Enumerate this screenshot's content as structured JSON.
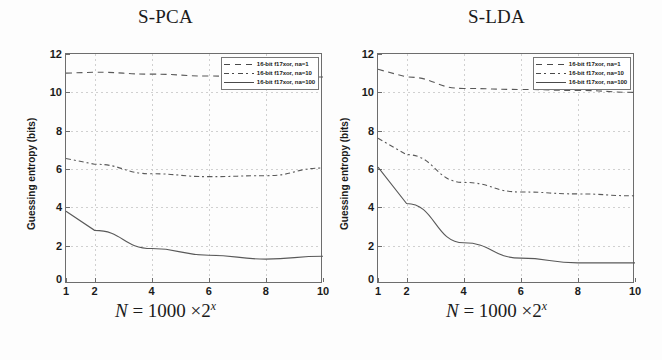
{
  "figure": {
    "panels": [
      {
        "key": "s_pca",
        "title": "S-PCA",
        "xlabel_prefix": "N",
        "xlabel_eq": "=",
        "xlabel_base": "1000",
        "xlabel_times": "×",
        "xlabel_pow_base": "2",
        "xlabel_pow_exp": "x",
        "ylabel": "Guessing entropy (bits)",
        "yticks": [
          "12",
          "10",
          "8",
          "6",
          "4",
          "2"
        ],
        "ytick_zero": "0",
        "xticks": [
          "1",
          "2",
          "4",
          "6",
          "8",
          "10"
        ],
        "legend": [
          {
            "label": "16-bit f17xor, na=1",
            "style": "dashed"
          },
          {
            "label": "16-bit f17xor, na=10",
            "style": "dashdot"
          },
          {
            "label": "16-bit f17xor, na=100",
            "style": "solid"
          }
        ]
      },
      {
        "key": "s_lda",
        "title": "S-LDA",
        "xlabel_prefix": "N",
        "xlabel_eq": "=",
        "xlabel_base": "1000",
        "xlabel_times": "×",
        "xlabel_pow_base": "2",
        "xlabel_pow_exp": "x",
        "ylabel": "Guessing entropy (bits)",
        "yticks": [
          "12",
          "10",
          "8",
          "6",
          "4",
          "2"
        ],
        "ytick_zero": "0",
        "xticks": [
          "1",
          "2",
          "4",
          "6",
          "8",
          "10"
        ],
        "legend": [
          {
            "label": "16-bit f17xor, na=1",
            "style": "dashed"
          },
          {
            "label": "16-bit f17xor, na=10",
            "style": "dashdot"
          },
          {
            "label": "16-bit f17xor, na=100",
            "style": "solid"
          }
        ]
      }
    ]
  },
  "chart_data": [
    {
      "type": "line",
      "title": "S-PCA",
      "xlabel": "N = 1000 × 2^x",
      "ylabel": "Guessing entropy (bits)",
      "xlim": [
        1,
        10
      ],
      "ylim": [
        0,
        12
      ],
      "xticks": [
        1,
        2,
        4,
        6,
        8,
        10
      ],
      "yticks": [
        0,
        2,
        4,
        6,
        8,
        10,
        12
      ],
      "grid": true,
      "legend_position": "top-right",
      "x": [
        1,
        2,
        4,
        6,
        8,
        10
      ],
      "series": [
        {
          "name": "16-bit f17xor, na=1",
          "style": "dashed",
          "values": [
            11.0,
            11.05,
            10.95,
            10.85,
            10.8,
            10.8
          ]
        },
        {
          "name": "16-bit f17xor, na=10",
          "style": "dashdot",
          "values": [
            6.55,
            6.25,
            5.75,
            5.6,
            5.65,
            6.05
          ]
        },
        {
          "name": "16-bit f17xor, na=100",
          "style": "solid",
          "values": [
            3.8,
            2.8,
            1.85,
            1.5,
            1.3,
            1.45
          ]
        }
      ]
    },
    {
      "type": "line",
      "title": "S-LDA",
      "xlabel": "N = 1000 × 2^x",
      "ylabel": "Guessing entropy (bits)",
      "xlim": [
        1,
        10
      ],
      "ylim": [
        0,
        12
      ],
      "xticks": [
        1,
        2,
        4,
        6,
        8,
        10
      ],
      "yticks": [
        0,
        2,
        4,
        6,
        8,
        10,
        12
      ],
      "grid": true,
      "legend_position": "top-right",
      "x": [
        1,
        2,
        4,
        6,
        8,
        10
      ],
      "series": [
        {
          "name": "16-bit f17xor, na=1",
          "style": "dashed",
          "values": [
            11.2,
            10.8,
            10.2,
            10.15,
            10.1,
            10.0
          ]
        },
        {
          "name": "16-bit f17xor, na=10",
          "style": "dashdot",
          "values": [
            7.6,
            6.75,
            5.3,
            4.8,
            4.7,
            4.6
          ]
        },
        {
          "name": "16-bit f17xor, na=100",
          "style": "solid",
          "values": [
            6.1,
            4.2,
            2.15,
            1.35,
            1.1,
            1.1
          ]
        }
      ]
    }
  ]
}
